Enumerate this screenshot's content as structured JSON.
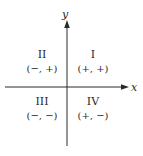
{
  "diagram": {
    "type": "cartesian-quadrants",
    "axes": {
      "x": {
        "label": "x"
      },
      "y": {
        "label": "y"
      }
    },
    "quadrants": [
      {
        "numeral": "II",
        "signs": "(−, +)"
      },
      {
        "numeral": "I",
        "signs": "(+, +)"
      },
      {
        "numeral": "III",
        "signs": "(−, −)"
      },
      {
        "numeral": "IV",
        "signs": "(+, −)"
      }
    ],
    "colors": {
      "line": "#2a2a2a",
      "text": "#2a2a2a",
      "background": "#ffffff"
    }
  }
}
